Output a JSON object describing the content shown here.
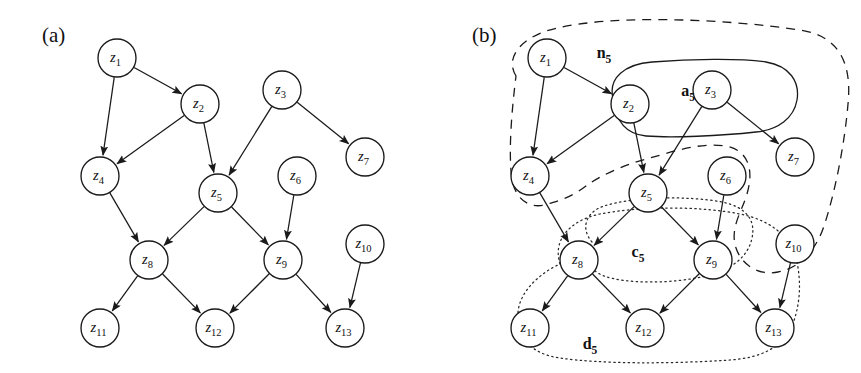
{
  "figure": {
    "width": 861,
    "height": 373,
    "background": "#ffffff",
    "stroke_color": "#1a1a1a",
    "type": "directed-acyclic-graph-diagram"
  },
  "panels": [
    {
      "id": "a",
      "label": "(a)",
      "label_x": 42,
      "label_y": 42
    },
    {
      "id": "b",
      "label": "(b)",
      "label_x": 472,
      "label_y": 42
    }
  ],
  "nodes_a": [
    {
      "id": "z1",
      "label": "z",
      "sub": "1",
      "cx": 117,
      "cy": 58,
      "r": 19
    },
    {
      "id": "z2",
      "label": "z",
      "sub": "2",
      "cx": 200,
      "cy": 104,
      "r": 19
    },
    {
      "id": "z3",
      "label": "z",
      "sub": "3",
      "cx": 282,
      "cy": 90,
      "r": 19
    },
    {
      "id": "z4",
      "label": "z",
      "sub": "4",
      "cx": 100,
      "cy": 176,
      "r": 19
    },
    {
      "id": "z5",
      "label": "z",
      "sub": "5",
      "cx": 218,
      "cy": 193,
      "r": 19
    },
    {
      "id": "z6",
      "label": "z",
      "sub": "6",
      "cx": 297,
      "cy": 176,
      "r": 19
    },
    {
      "id": "z7",
      "label": "z",
      "sub": "7",
      "cx": 365,
      "cy": 157,
      "r": 19
    },
    {
      "id": "z8",
      "label": "z",
      "sub": "8",
      "cx": 149,
      "cy": 260,
      "r": 19
    },
    {
      "id": "z9",
      "label": "z",
      "sub": "9",
      "cx": 283,
      "cy": 260,
      "r": 19
    },
    {
      "id": "z10",
      "label": "z",
      "sub": "10",
      "cx": 365,
      "cy": 244,
      "r": 19
    },
    {
      "id": "z11",
      "label": "z",
      "sub": "11",
      "cx": 100,
      "cy": 328,
      "r": 19
    },
    {
      "id": "z12",
      "label": "z",
      "sub": "12",
      "cx": 215,
      "cy": 328,
      "r": 19
    },
    {
      "id": "z13",
      "label": "z",
      "sub": "13",
      "cx": 345,
      "cy": 328,
      "r": 19
    }
  ],
  "edges": [
    {
      "from": "z1",
      "to": "z2"
    },
    {
      "from": "z1",
      "to": "z4"
    },
    {
      "from": "z2",
      "to": "z4"
    },
    {
      "from": "z2",
      "to": "z5"
    },
    {
      "from": "z3",
      "to": "z5"
    },
    {
      "from": "z3",
      "to": "z7"
    },
    {
      "from": "z4",
      "to": "z8"
    },
    {
      "from": "z5",
      "to": "z8"
    },
    {
      "from": "z5",
      "to": "z9"
    },
    {
      "from": "z6",
      "to": "z9"
    },
    {
      "from": "z8",
      "to": "z11"
    },
    {
      "from": "z8",
      "to": "z12"
    },
    {
      "from": "z9",
      "to": "z12"
    },
    {
      "from": "z9",
      "to": "z13"
    },
    {
      "from": "z10",
      "to": "z13"
    }
  ],
  "panel_b_offset": {
    "dx": 430,
    "dy": 0
  },
  "sets": [
    {
      "id": "n5",
      "label": "n",
      "sub": "5",
      "style": "dashed",
      "label_x": 604,
      "label_y": 58,
      "members": [
        "z1",
        "z2",
        "z3",
        "z4",
        "z5",
        "z6",
        "z7",
        "z10"
      ],
      "caption": "neighbourhood set of z5"
    },
    {
      "id": "a5",
      "label": "a",
      "sub": "5",
      "style": "solid",
      "label_x": 688,
      "label_y": 96,
      "members": [
        "z2",
        "z3"
      ],
      "caption": "ancestor/parent set of z5"
    },
    {
      "id": "c5",
      "label": "c",
      "sub": "5",
      "style": "dotted",
      "label_x": 638,
      "label_y": 257,
      "members": [
        "z8",
        "z9"
      ],
      "caption": "child set of z5"
    },
    {
      "id": "d5",
      "label": "d",
      "sub": "5",
      "style": "dotted",
      "label_x": 590,
      "label_y": 349,
      "members": [
        "z8",
        "z9",
        "z11",
        "z12",
        "z13"
      ],
      "caption": "descendant set of z5"
    }
  ],
  "region_paths": {
    "n5": "M 516 76 C 505 58, 520 40, 546 31 C 600 14, 720 18, 800 30 C 840 36, 852 64, 848 104 C 845 140, 836 190, 824 226 C 816 250, 800 268, 778 272 C 760 276, 742 266, 736 248 C 730 230, 740 214, 745 200 C 756 170, 748 150, 726 146 C 700 142, 672 152, 650 158 C 620 166, 600 176, 586 186 C 570 198, 560 200, 548 204 C 530 210, 516 200, 512 180 C 508 152, 512 108, 516 76 Z",
    "a5": "M 613 98 C 608 78, 625 64, 652 62 C 690 59, 740 58, 766 62 C 790 66, 800 82, 797 100 C 794 118, 778 130, 756 132 C 720 136, 672 138, 646 136 C 624 134, 615 118, 613 98 Z",
    "c5": "M 592 242 C 580 228, 586 212, 604 206 C 636 196, 690 196, 722 202 C 746 207, 756 220, 752 238 C 748 258, 730 270, 706 276 C 672 284, 626 284, 604 276 C 588 270, 584 256, 592 242 Z",
    "d5": "M 560 264 C 552 238, 572 220, 600 214 C 640 206, 700 206, 740 214 C 770 220, 790 236, 796 258 C 802 282, 800 306, 792 326 C 782 348, 760 358, 730 360 C 670 364, 600 364, 560 358 C 530 354, 516 336, 518 312 C 520 290, 542 272, 560 264 Z"
  }
}
